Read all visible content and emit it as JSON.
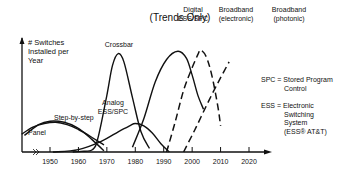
{
  "chart_data": {
    "type": "line",
    "title": "(Trends Only)",
    "ylabel": [
      "# Switches",
      "Installed per",
      "Year"
    ],
    "xlabel": "",
    "xlim": [
      1940,
      2030
    ],
    "ylim": [
      0,
      10
    ],
    "x_ticks": [
      1950,
      1960,
      1970,
      1980,
      1990,
      2000,
      2010,
      2020
    ],
    "x_tick_labels": [
      "1950",
      "1960",
      "1970",
      "1980",
      "1990",
      "2000",
      "2010",
      "2020"
    ],
    "axis_break": true,
    "grid": false,
    "series": [
      {
        "name": "Panel",
        "style": "solid",
        "x": [
          1940,
          1944,
          1948,
          1952,
          1956,
          1960,
          1965,
          1969
        ],
        "y": [
          1.5,
          2.1,
          2.4,
          2.5,
          2.3,
          1.9,
          1.2,
          0.6
        ]
      },
      {
        "name": "Step-by-step",
        "style": "solid",
        "x": [
          1941,
          1946,
          1950,
          1955,
          1960,
          1965,
          1969
        ],
        "y": [
          1.4,
          2.3,
          2.6,
          2.5,
          2.0,
          1.0,
          0.1
        ]
      },
      {
        "name": "Crossbar",
        "style": "solid",
        "x": [
          1958,
          1961,
          1965,
          1967,
          1970,
          1972,
          1974,
          1976,
          1979,
          1982,
          1985
        ],
        "y": [
          0,
          0.05,
          0.2,
          1.3,
          4.8,
          7.3,
          8.3,
          7.6,
          4.6,
          1.7,
          0.3
        ]
      },
      {
        "name": "Analog ESS/SPC",
        "style": "solid",
        "x": [
          1951,
          1960,
          1968,
          1974,
          1978,
          1980,
          1983,
          1986,
          1989,
          1992
        ],
        "y": [
          0,
          0.2,
          0.9,
          1.7,
          2.2,
          2.4,
          2.2,
          1.6,
          0.7,
          0
        ]
      },
      {
        "name": "Digital ESS/SPC",
        "style": "solid",
        "x": [
          1979,
          1983,
          1987,
          1991,
          1995,
          1998,
          2000,
          2002,
          2004
        ],
        "y": [
          0.4,
          2.8,
          5.9,
          7.8,
          8.5,
          7.9,
          6.5,
          4.8,
          3.6
        ]
      },
      {
        "name": "Broadband (electronic)",
        "style": "dashed",
        "x": [
          1991,
          1994,
          1997,
          2000,
          2002,
          2003,
          2005,
          2007,
          2009,
          2010
        ],
        "y": [
          0,
          2.5,
          5.2,
          7.1,
          8.2,
          8.6,
          8.0,
          6.4,
          3.9,
          2.2
        ]
      },
      {
        "name": "Broadband (photonic)",
        "style": "dashed",
        "x": [
          1997,
          2001,
          2005,
          2009,
          2013
        ],
        "y": [
          0,
          1.9,
          3.9,
          5.8,
          7.6
        ]
      }
    ],
    "annotations": [
      {
        "text": [
          "Panel"
        ],
        "series": "Panel"
      },
      {
        "text": [
          "Step-by-step"
        ],
        "series": "Step-by-step"
      },
      {
        "text": [
          "Crossbar"
        ],
        "series": "Crossbar"
      },
      {
        "text": [
          "Analog",
          "ESS/SPC"
        ],
        "series": "Analog ESS/SPC"
      },
      {
        "text": [
          "Digital",
          "ESS/SPC"
        ],
        "series": "Digital ESS/SPC"
      },
      {
        "text": [
          "Broadband",
          "(electronic)"
        ],
        "series": "Broadband (electronic)"
      },
      {
        "text": [
          "Broadband",
          "(photonic)"
        ],
        "series": "Broadband (photonic)"
      }
    ],
    "legend_notes": [
      {
        "text": [
          "SPC = Stored Program",
          "Control"
        ]
      },
      {
        "text": [
          "ESS = Electronic",
          "Switching",
          "System",
          "(ESS® AT&T)"
        ]
      }
    ],
    "legend_placement": "right"
  }
}
